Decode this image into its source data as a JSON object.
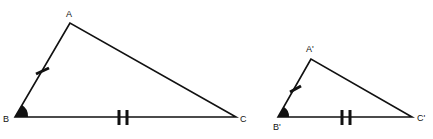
{
  "diagram": {
    "line_color": "#111111",
    "triangles": [
      {
        "name": "ABC",
        "vertices": {
          "A": {
            "label": "A",
            "x": 70,
            "y": 23
          },
          "B": {
            "label": "B",
            "x": 15,
            "y": 117
          },
          "C": {
            "label": "C",
            "x": 236,
            "y": 117
          }
        },
        "marks": {
          "AB": "single tick",
          "BC": "double tick",
          "angle_B": "filled angle"
        }
      },
      {
        "name": "A'B'C'",
        "vertices": {
          "A": {
            "label": "A'",
            "x": 311,
            "y": 59
          },
          "B": {
            "label": "B'",
            "x": 278,
            "y": 117
          },
          "C": {
            "label": "C'",
            "x": 412,
            "y": 117
          }
        },
        "marks": {
          "AB": "single tick",
          "BC": "double tick",
          "angle_B": "filled angle"
        }
      }
    ]
  }
}
